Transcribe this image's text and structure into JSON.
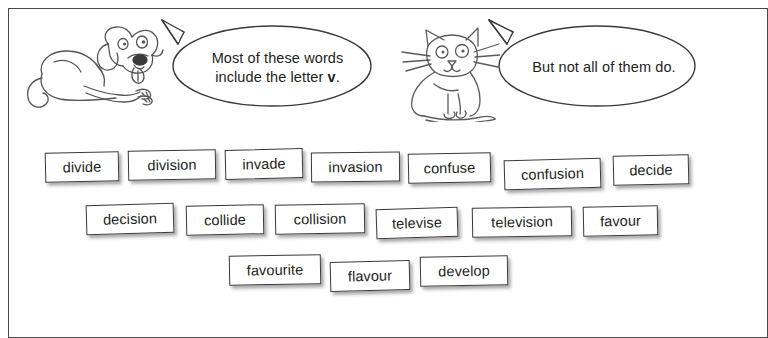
{
  "page": {
    "background_color": "#ffffff",
    "frame_color": "#4a4a4a",
    "text_color": "#231f20"
  },
  "characters": [
    {
      "name": "dog",
      "icon": "dog-illustration",
      "description": "line drawing of a lying dog with floppy ears and tongue out"
    },
    {
      "name": "cat",
      "icon": "cat-illustration",
      "description": "line drawing of a sitting cat with whiskers and long tail"
    }
  ],
  "speech_bubbles": [
    {
      "speaker": "dog",
      "line1": "Most of these words",
      "line2_prefix": "include the letter ",
      "line2_bold": "v",
      "line2_suffix": "."
    },
    {
      "speaker": "cat",
      "text": "But not all of them do."
    }
  ],
  "word_cards": {
    "rows": [
      {
        "row": 1,
        "words": [
          {
            "label": "divide",
            "x": 45,
            "y": 152,
            "w": 74,
            "h": 30,
            "rot": -1.2
          },
          {
            "label": "division",
            "x": 128,
            "y": 150,
            "w": 88,
            "h": 30,
            "rot": -1.0
          },
          {
            "label": "invade",
            "x": 225,
            "y": 149,
            "w": 78,
            "h": 30,
            "rot": -1.4
          },
          {
            "label": "invasion",
            "x": 311,
            "y": 152,
            "w": 89,
            "h": 30,
            "rot": -0.6
          },
          {
            "label": "confuse",
            "x": 408,
            "y": 153,
            "w": 83,
            "h": 30,
            "rot": -1.2
          },
          {
            "label": "confusion",
            "x": 504,
            "y": 159,
            "w": 97,
            "h": 30,
            "rot": -1.6
          },
          {
            "label": "decide",
            "x": 613,
            "y": 155,
            "w": 76,
            "h": 30,
            "rot": -1.3
          }
        ]
      },
      {
        "row": 2,
        "words": [
          {
            "label": "decision",
            "x": 86,
            "y": 204,
            "w": 88,
            "h": 30,
            "rot": -1.6
          },
          {
            "label": "collide",
            "x": 186,
            "y": 205,
            "w": 78,
            "h": 30,
            "rot": -1.2
          },
          {
            "label": "collision",
            "x": 275,
            "y": 204,
            "w": 90,
            "h": 30,
            "rot": -1.0
          },
          {
            "label": "televise",
            "x": 376,
            "y": 208,
            "w": 82,
            "h": 30,
            "rot": -1.8
          },
          {
            "label": "television",
            "x": 472,
            "y": 207,
            "w": 100,
            "h": 30,
            "rot": -1.0
          },
          {
            "label": "favour",
            "x": 583,
            "y": 206,
            "w": 75,
            "h": 30,
            "rot": -1.2
          }
        ]
      },
      {
        "row": 3,
        "words": [
          {
            "label": "favourite",
            "x": 229,
            "y": 255,
            "w": 92,
            "h": 30,
            "rot": -1.0
          },
          {
            "label": "flavour",
            "x": 330,
            "y": 261,
            "w": 80,
            "h": 30,
            "rot": -1.4
          },
          {
            "label": "develop",
            "x": 420,
            "y": 256,
            "w": 88,
            "h": 30,
            "rot": -1.0
          }
        ]
      }
    ]
  }
}
